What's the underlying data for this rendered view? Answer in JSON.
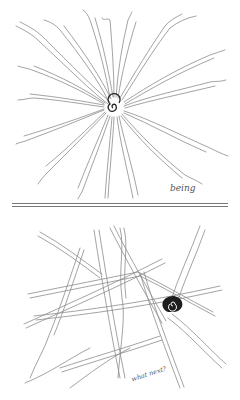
{
  "illustration": {
    "top_panel": {
      "caption": "being",
      "motif": "radiating wavy double-lines from a central spiral"
    },
    "bottom_panel": {
      "caption": "what next?",
      "motif": "tangled crossing double-lines with a dark spiral"
    }
  },
  "colors": {
    "background": "#ffffff",
    "stroke": "#8a8a8a",
    "spiral": "#222222"
  }
}
